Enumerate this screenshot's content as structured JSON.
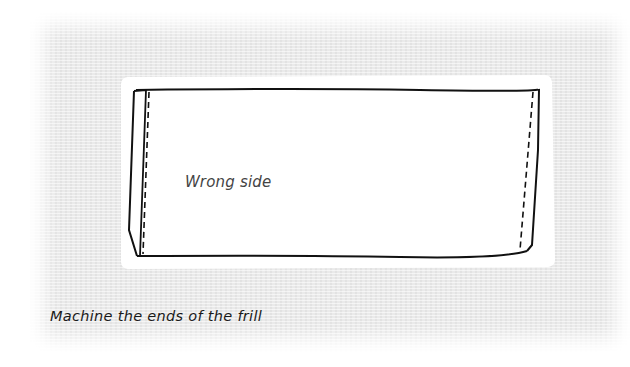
{
  "illustration": {
    "subject": "folded frill rectangle with machine-stitched ends",
    "inner_label": "Wrong side",
    "caption": "Machine the ends of the frill",
    "colors": {
      "background_panel": "#e9e9e9",
      "fabric": "#ffffff",
      "outline": "#111111",
      "label_text": "#444444",
      "caption_text": "#1a1a1a"
    }
  }
}
